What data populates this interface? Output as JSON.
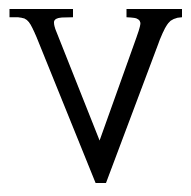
{
  "image": {
    "kind": "letterform-glyph",
    "character": "V",
    "character_name": "latin-capital-letter-v",
    "typeface_style": "serif",
    "width_px": 191,
    "height_px": 196,
    "background_color": "#ffffff",
    "glyph_color": "#000000",
    "alt_text": "V"
  },
  "glyph": {
    "label": "V",
    "bounding_box": {
      "left_px": 9,
      "top_px": 9,
      "right_px": 182,
      "bottom_px": 183
    },
    "left_serif": {
      "name": "top-left-serif",
      "start_x_px": 9,
      "end_x_px": 73,
      "top_y_px": 9,
      "bar_thickness_px": 8
    },
    "right_serif": {
      "name": "top-right-serif",
      "start_x_px": 126,
      "end_x_px": 182,
      "top_y_px": 9,
      "bar_thickness_px": 8
    },
    "thick_stroke": {
      "name": "left-diagonal-thick-stroke",
      "width_at_mid_px": 30
    },
    "thin_stroke": {
      "name": "right-diagonal-thin-stroke",
      "width_at_mid_px": 17
    },
    "apex": {
      "name": "bottom-apex",
      "x_px": 98,
      "y_px": 183
    },
    "outline_path": "M 9.5 9.0 L 73.0 9.0 L 73.0 17.2 L 62.0 17.6 C 56.6 17.9 54.0 19.6 54.0 22.8 C 54.0 24.8 54.8 27.8 56.4 31.8 L 99.6 140.5 L 136.6 37.0 C 139.1 30.0 140.4 25.4 140.4 23.2 C 140.4 19.6 137.2 17.7 130.8 17.4 L 126.5 17.2 L 126.5 9.0 L 182.0 9.0 L 182.0 17.2 C 175.6 17.6 171.0 19.6 168.2 23.2 C 165.4 26.8 162.2 33.4 158.6 43.0 L 106.0 183.0 L 95.6 183.0 L 36.6 37.2 C 33.6 29.8 31.0 24.7 28.8 21.9 C 26.6 19.1 23.0 17.6 18.0 17.3 L 9.5 17.2 Z"
  }
}
